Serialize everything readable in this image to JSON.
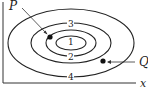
{
  "diagram": {
    "type": "contour_plot",
    "axes": {
      "x_label": "x",
      "y_axis_visible": true
    },
    "contours": [
      {
        "label": "1",
        "level": 1
      },
      {
        "label": "2",
        "level": 2
      },
      {
        "label": "3",
        "level": 3
      },
      {
        "label": "4",
        "level": 4
      }
    ],
    "points": [
      {
        "label": "P",
        "description": "point on contour between 2 and 3, upper left"
      },
      {
        "label": "Q",
        "description": "point between contours 2 and 4, lower right"
      }
    ],
    "colors": {
      "stroke": "#222222",
      "background": "#ffffff"
    }
  }
}
